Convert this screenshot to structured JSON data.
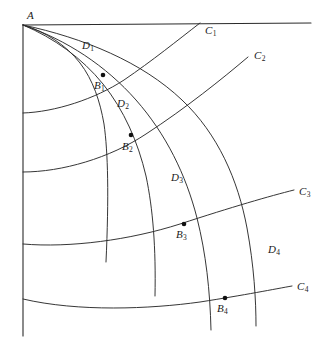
{
  "figure": {
    "stroke_color": "#2b2b2b",
    "background_color": "#ffffff",
    "point_color": "#111111",
    "labels": {
      "A": {
        "text": "A",
        "sub": "",
        "x": 27,
        "y": 10
      },
      "C1": {
        "text": "C",
        "sub": "1",
        "x": 205,
        "y": 25
      },
      "C2": {
        "text": "C",
        "sub": "2",
        "x": 254,
        "y": 50
      },
      "C3": {
        "text": "C",
        "sub": "3",
        "x": 299,
        "y": 186
      },
      "C4": {
        "text": "C",
        "sub": "4",
        "x": 297,
        "y": 281
      },
      "D1": {
        "text": "D",
        "sub": "1",
        "x": 82,
        "y": 40
      },
      "D2": {
        "text": "D",
        "sub": "2",
        "x": 117,
        "y": 98
      },
      "D3": {
        "text": "D",
        "sub": "3",
        "x": 171,
        "y": 172
      },
      "D4": {
        "text": "D",
        "sub": "4",
        "x": 268,
        "y": 244
      },
      "B1": {
        "text": "B",
        "sub": "1",
        "x": 94,
        "y": 80
      },
      "B2": {
        "text": "B",
        "sub": "2",
        "x": 122,
        "y": 141
      },
      "B3": {
        "text": "B",
        "sub": "3",
        "x": 176,
        "y": 229
      },
      "B4": {
        "text": "B",
        "sub": "4",
        "x": 217,
        "y": 303
      }
    },
    "vertex": {
      "name": "A",
      "x": 23,
      "y": 25
    },
    "boundary": {
      "top_line": {
        "x1": 23,
        "y1": 25,
        "x2": 311,
        "y2": 23
      },
      "left_line": {
        "x1": 23,
        "y1": 25,
        "x2": 23,
        "y2": 336
      }
    },
    "points": [
      {
        "name": "B1",
        "x": 103,
        "y": 75,
        "r": 2.3
      },
      {
        "name": "B2",
        "x": 131,
        "y": 135,
        "r": 2.3
      },
      {
        "name": "B3",
        "x": 184,
        "y": 224,
        "r": 2.3
      },
      {
        "name": "B4",
        "x": 225,
        "y": 298,
        "r": 2.3
      }
    ],
    "c_curves": [
      {
        "name": "C1",
        "d": "M 23,113 C 55,112 95,99 124,80 C 152,61 178,40 200,23"
      },
      {
        "name": "C2",
        "d": "M 23,172 C 62,172 110,158 146,134 C 186,108 222,79 248,57"
      },
      {
        "name": "C3",
        "d": "M 23,244 C 70,248 130,240 180,224 C 232,207 270,196 294,190"
      },
      {
        "name": "C4",
        "d": "M 23,299 C 78,312 150,309 200,302 C 245,295 275,289 292,286"
      }
    ],
    "d_curves": [
      {
        "name": "D1",
        "d": "M 23,25 C 46,32 66,45 80,63 C 93,80 100,101 104,124 C 108,152 109,196 106,262"
      },
      {
        "name": "D2",
        "d": "M 23,25 C 54,38 82,58 103,84 C 124,110 138,142 146,176 C 153,209 156,248 155,296"
      },
      {
        "name": "D3",
        "d": "M 23,25 C 67,40 106,66 136,100 C 166,134 186,175 197,218 C 206,254 210,290 211,330"
      },
      {
        "name": "D4",
        "d": "M 23,25 C 84,38 142,62 182,100 C 218,134 238,180 247,228 C 254,266 256,300 256,326"
      }
    ]
  }
}
